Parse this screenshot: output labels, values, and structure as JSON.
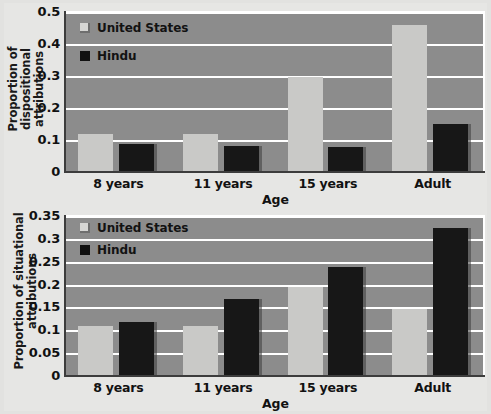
{
  "chart_data": [
    {
      "type": "bar",
      "title": "",
      "xlabel": "Age",
      "ylabel": "Proportion of dispositional attributions",
      "categories": [
        "8 years",
        "11 years",
        "15 years",
        "Adult"
      ],
      "series": [
        {
          "name": "United States",
          "color": "#c9c9c7",
          "values": [
            0.117,
            0.115,
            0.295,
            0.455
          ]
        },
        {
          "name": "Hindu",
          "color": "#171717",
          "values": [
            0.085,
            0.077,
            0.075,
            0.147
          ]
        }
      ],
      "ylim": [
        0,
        0.5
      ],
      "yticks": [
        0,
        0.1,
        0.2,
        0.3,
        0.4,
        0.5
      ],
      "ytick_labels": [
        "0",
        "0.1",
        "0.2",
        "0.3",
        "0.4",
        "0.5"
      ],
      "grid": true,
      "legend_position": "top-left"
    },
    {
      "type": "bar",
      "title": "",
      "xlabel": "Age",
      "ylabel": "Proportion of situational attributions",
      "categories": [
        "8 years",
        "11 years",
        "15 years",
        "Adult"
      ],
      "series": [
        {
          "name": "United States",
          "color": "#c9c9c7",
          "values": [
            0.107,
            0.107,
            0.192,
            0.145
          ]
        },
        {
          "name": "Hindu",
          "color": "#171717",
          "values": [
            0.116,
            0.167,
            0.237,
            0.321
          ]
        }
      ],
      "ylim": [
        0,
        0.35
      ],
      "yticks": [
        0,
        0.05,
        0.1,
        0.15,
        0.2,
        0.25,
        0.3,
        0.35
      ],
      "ytick_labels": [
        "0",
        "0.05",
        "0.1",
        "0.15",
        "0.2",
        "0.25",
        "0.3",
        "0.35"
      ],
      "grid": true,
      "legend_position": "top-left"
    }
  ],
  "colors": {
    "plot_background": "#8c8c8c",
    "page_background": "#e6e6e4",
    "gridline": "#ffffff",
    "axis": "#3c3c3c",
    "united_states": "#c9c9c7",
    "hindu": "#171717"
  }
}
